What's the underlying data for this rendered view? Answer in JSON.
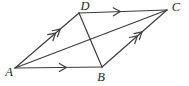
{
  "figure": {
    "background_color": "#ffffff",
    "line_color": "#3d3d3d",
    "label_color": "#1f1f1f",
    "line_width": 1.2,
    "vertices": {
      "A": {
        "x": 15,
        "y": 68
      },
      "B": {
        "x": 102,
        "y": 67
      },
      "C": {
        "x": 167,
        "y": 10
      },
      "D": {
        "x": 79,
        "y": 13
      }
    },
    "vertex_labels": {
      "A": {
        "text": "A",
        "x": 9,
        "y": 76
      },
      "B": {
        "text": "B",
        "x": 101,
        "y": 81
      },
      "C": {
        "text": "C",
        "x": 176,
        "y": 11
      },
      "D": {
        "text": "D",
        "x": 85,
        "y": 10
      }
    },
    "edges": [
      {
        "name": "AB",
        "from": "A",
        "to": "B",
        "parallel_marks": 1,
        "mark_t": 0.59
      },
      {
        "name": "DC",
        "from": "D",
        "to": "C",
        "parallel_marks": 1,
        "mark_t": 0.47
      },
      {
        "name": "AD",
        "from": "A",
        "to": "D",
        "parallel_marks": 2,
        "mark_t": 0.67
      },
      {
        "name": "BC",
        "from": "B",
        "to": "C",
        "parallel_marks": 2,
        "mark_t": 0.58
      }
    ],
    "diagonals": [
      {
        "name": "AC",
        "from": "A",
        "to": "C"
      },
      {
        "name": "DB",
        "from": "D",
        "to": "B"
      }
    ]
  }
}
